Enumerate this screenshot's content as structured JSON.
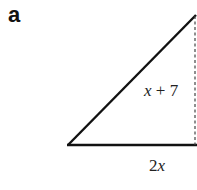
{
  "part_label": "a",
  "diagram": {
    "type": "right-triangle",
    "height_label": "x + 7",
    "base_label": "2x",
    "colors": {
      "stroke": "#111111",
      "text": "#222222",
      "dashed": "#444444"
    }
  }
}
